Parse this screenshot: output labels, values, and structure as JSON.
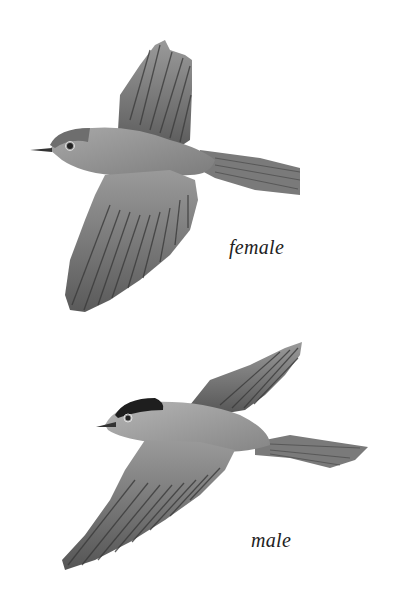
{
  "plate": {
    "birds": [
      {
        "label": "female",
        "cap_color": "#6e6e6e"
      },
      {
        "label": "male",
        "cap_color": "#1e1e1e"
      }
    ],
    "colors": {
      "background": "#ffffff",
      "plumage": "#8a8a8a",
      "feather_dark": "#4a4a4a",
      "text": "#222222"
    }
  }
}
